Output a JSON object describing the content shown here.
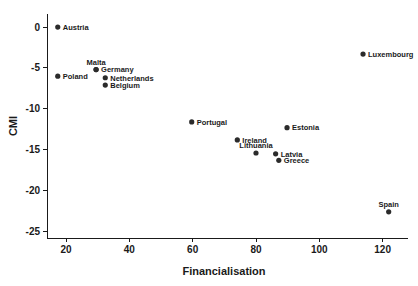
{
  "chart_data": {
    "type": "scatter",
    "title": "",
    "xlabel": "Financialisation",
    "ylabel": "CMI",
    "xlim": [
      14,
      128
    ],
    "ylim": [
      -25.8,
      1.6
    ],
    "xticks": [
      20,
      40,
      60,
      80,
      100,
      120
    ],
    "yticks": [
      0,
      -5,
      -10,
      -15,
      -20,
      -25
    ],
    "xticklabels": [
      "20",
      "40",
      "60",
      "80",
      "100",
      "120"
    ],
    "yticklabels": [
      "0",
      "-5",
      "-10",
      "-15",
      "-20",
      "-25"
    ],
    "grid": false,
    "legend": "none",
    "marker_color": "#2b2b2b",
    "axis_color": "#1a1a1a",
    "background": "#ffffff",
    "points": [
      {
        "label": "Austria",
        "x": 17.4,
        "y": 0.0,
        "label_pos": "right"
      },
      {
        "label": "Poland",
        "x": 17.4,
        "y": -6.0,
        "label_pos": "right"
      },
      {
        "label": "Malta",
        "x": 29.5,
        "y": -5.2,
        "label_pos": "above"
      },
      {
        "label": "Germany",
        "x": 29.5,
        "y": -5.2,
        "label_pos": "right"
      },
      {
        "label": "Netherlands",
        "x": 32.4,
        "y": -6.2,
        "label_pos": "right"
      },
      {
        "label": "Belgium",
        "x": 32.4,
        "y": -7.1,
        "label_pos": "right"
      },
      {
        "label": "Portugal",
        "x": 59.7,
        "y": -11.6,
        "label_pos": "right"
      },
      {
        "label": "Ireland",
        "x": 74.1,
        "y": -13.8,
        "label_pos": "right"
      },
      {
        "label": "Lithuania",
        "x": 80.0,
        "y": -15.4,
        "label_pos": "above"
      },
      {
        "label": "Latvia",
        "x": 86.2,
        "y": -15.5,
        "label_pos": "right"
      },
      {
        "label": "Greece",
        "x": 87.2,
        "y": -16.3,
        "label_pos": "right"
      },
      {
        "label": "Estonia",
        "x": 89.8,
        "y": -12.3,
        "label_pos": "right"
      },
      {
        "label": "Luxembourg",
        "x": 113.8,
        "y": -3.3,
        "label_pos": "right"
      },
      {
        "label": "Spain",
        "x": 121.9,
        "y": -22.6,
        "label_pos": "above"
      }
    ]
  }
}
